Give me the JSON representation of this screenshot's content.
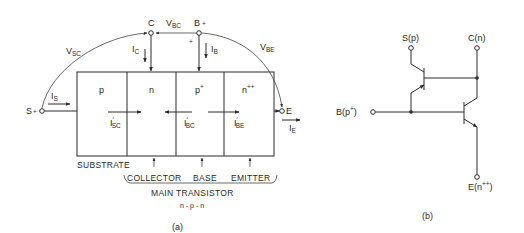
{
  "figure_a": {
    "caption": "(a)",
    "regions": [
      {
        "doping": "p"
      },
      {
        "doping": "n"
      },
      {
        "doping": "p",
        "sup": "+"
      },
      {
        "doping": "n",
        "sup": "++"
      }
    ],
    "terminals": {
      "collector": {
        "label": "C"
      },
      "base": {
        "label": "B",
        "sign": "+"
      },
      "substrate": {
        "label": "S",
        "sign": "+"
      },
      "emitter": {
        "label": "E"
      }
    },
    "voltages": {
      "vsc": {
        "main": "V",
        "sub": "SC"
      },
      "vbc": {
        "main": "V",
        "sub": "BC"
      },
      "vbe": {
        "main": "V",
        "sub": "BE"
      }
    },
    "polarity_marks": {
      "collector_minus": "-",
      "base_plus": "+"
    },
    "currents": {
      "ic": {
        "main": "I",
        "sub": "C"
      },
      "ib": {
        "main": "I",
        "sub": "B"
      },
      "is": {
        "main": "I",
        "sub": "S"
      },
      "ie": {
        "main": "I",
        "sub": "E"
      },
      "isc_prime": {
        "main": "I",
        "prime": "′",
        "sub": "SC"
      },
      "ibc_prime": {
        "main": "I",
        "prime": "′",
        "sub": "BC"
      },
      "ibe_prime": {
        "main": "I",
        "prime": "′",
        "sub": "BE"
      }
    },
    "bottom_labels": {
      "substrate": "SUBSTRATE",
      "collector": "COLLECTOR",
      "base": "BASE",
      "emitter": "EMITTER",
      "main_transistor": "MAIN TRANSISTOR",
      "type": "n - p - n"
    }
  },
  "figure_b": {
    "caption": "(b)",
    "terminals": {
      "substrate": "S(p)",
      "collector": "C(n)",
      "base_main": "B(p",
      "base_sup": "+",
      "base_close": ")",
      "emitter_main": "E(n",
      "emitter_sup": "++",
      "emitter_close": ")"
    }
  }
}
